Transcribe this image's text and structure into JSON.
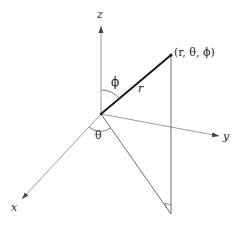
{
  "diagram": {
    "type": "spherical-coordinates",
    "axes": {
      "x": {
        "label": "x"
      },
      "y": {
        "label": "y"
      },
      "z": {
        "label": "z"
      }
    },
    "point_label": "(r, θ, ϕ)",
    "radius_label": "r",
    "polar_angle_label": "ϕ",
    "azimuth_angle_label": "θ",
    "colors": {
      "axis": "#9a9a9a",
      "radius": "#1a1a1a",
      "construction": "#6e6e6e",
      "text": "#222222"
    }
  }
}
